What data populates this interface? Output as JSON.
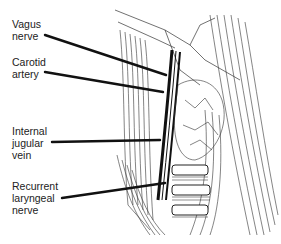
{
  "diagram": {
    "labels": [
      {
        "id": "vagus",
        "lines": [
          "Vagus",
          "nerve"
        ]
      },
      {
        "id": "carotid",
        "lines": [
          "Carotid",
          "artery"
        ]
      },
      {
        "id": "jugular",
        "lines": [
          "Internal",
          "jugular",
          "vein"
        ]
      },
      {
        "id": "laryngeal",
        "lines": [
          "Recurrent",
          "laryngeal",
          "nerve"
        ]
      }
    ],
    "colors": {
      "ink": "#222222",
      "background": "#ffffff"
    }
  }
}
